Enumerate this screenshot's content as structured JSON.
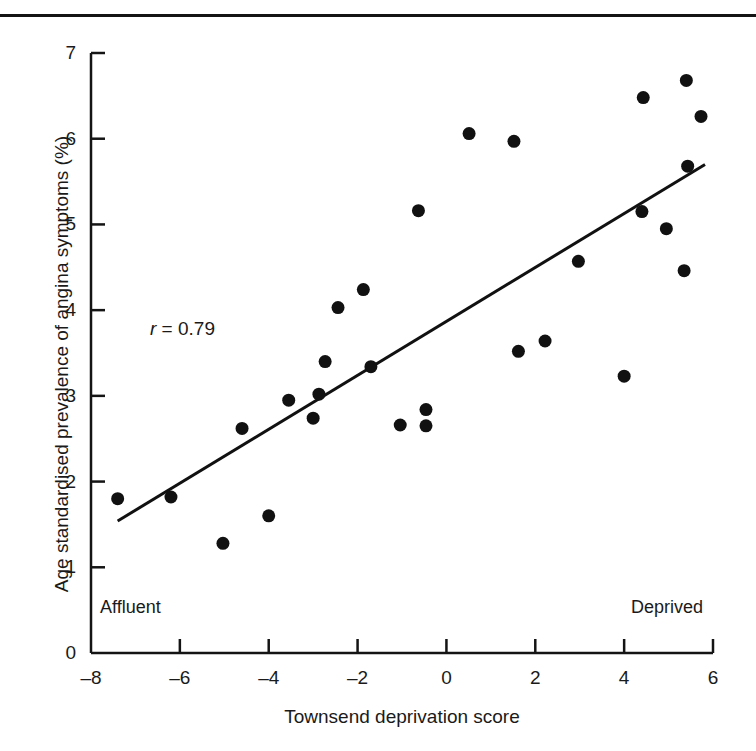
{
  "chart_data": {
    "type": "scatter",
    "title": "",
    "xlabel": "Townsend deprivation score",
    "ylabel": "Age standardised prevalence of angina symptoms (%)",
    "xlim": [
      -8,
      6
    ],
    "ylim": [
      0,
      7
    ],
    "xticks": [
      -8,
      -6,
      -4,
      -2,
      0,
      2,
      4,
      6
    ],
    "xtick_labels": [
      "–8",
      "–6",
      "–4",
      "–2",
      "0",
      "2",
      "4",
      "6"
    ],
    "yticks": [
      0,
      1,
      2,
      3,
      4,
      5,
      6,
      7
    ],
    "ytick_labels": [
      "0",
      "1",
      "2",
      "3",
      "4",
      "5",
      "6",
      "7"
    ],
    "grid": false,
    "legend": null,
    "marker": "filled-circle",
    "marker_color": "#111111",
    "marker_size": 13,
    "points": [
      {
        "x": -7.4,
        "y": 1.8
      },
      {
        "x": -6.2,
        "y": 1.82
      },
      {
        "x": -5.03,
        "y": 1.28
      },
      {
        "x": -4.6,
        "y": 2.62
      },
      {
        "x": -4.0,
        "y": 1.6
      },
      {
        "x": -3.55,
        "y": 2.95
      },
      {
        "x": -3.0,
        "y": 2.74
      },
      {
        "x": -2.87,
        "y": 3.02
      },
      {
        "x": -2.73,
        "y": 3.4
      },
      {
        "x": -2.44,
        "y": 4.03
      },
      {
        "x": -1.87,
        "y": 4.24
      },
      {
        "x": -1.7,
        "y": 3.34
      },
      {
        "x": -1.04,
        "y": 2.66
      },
      {
        "x": -0.63,
        "y": 5.16
      },
      {
        "x": -0.46,
        "y": 2.84
      },
      {
        "x": -0.46,
        "y": 2.65
      },
      {
        "x": 0.51,
        "y": 6.06
      },
      {
        "x": 1.52,
        "y": 5.97
      },
      {
        "x": 1.62,
        "y": 3.52
      },
      {
        "x": 2.22,
        "y": 3.64
      },
      {
        "x": 2.97,
        "y": 4.57
      },
      {
        "x": 4.0,
        "y": 3.23
      },
      {
        "x": 4.43,
        "y": 6.48
      },
      {
        "x": 4.4,
        "y": 5.15
      },
      {
        "x": 4.95,
        "y": 4.95
      },
      {
        "x": 5.35,
        "y": 4.46
      },
      {
        "x": 5.4,
        "y": 6.68
      },
      {
        "x": 5.43,
        "y": 5.68
      },
      {
        "x": 5.73,
        "y": 6.26
      }
    ],
    "fit_line": {
      "x0": -7.4,
      "y0": 1.54,
      "x1": 5.82,
      "y1": 5.7,
      "color": "#111111",
      "width": 3
    },
    "annotations": {
      "correlation_prefix": "r",
      "correlation_text": " = 0.79",
      "x_left_note": "Affluent",
      "x_right_note": "Deprived"
    }
  },
  "figure": {
    "axis_color": "#141414",
    "background": "#ffffff",
    "top_rule_color": "#141414"
  }
}
